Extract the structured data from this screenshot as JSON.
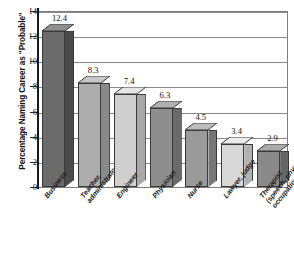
{
  "chart_data": {
    "type": "bar",
    "title": "",
    "xlabel": "",
    "ylabel": "Percentage Naming Career as \"Probable\"",
    "ylim": [
      0,
      14
    ],
    "yticks": [
      0,
      2,
      4,
      6,
      8,
      10,
      12,
      14
    ],
    "ytick_labels": [
      "0",
      "2",
      "4",
      "6",
      "8",
      "10",
      "12",
      "14"
    ],
    "grid": true,
    "legend": "none",
    "categories": [
      "Business",
      "Teacher, administrator",
      "Engineer",
      "Physician",
      "Nurse",
      "Lawyer, judge",
      "Therapist (speech, physical, occupational)"
    ],
    "category_lines": [
      [
        "Business"
      ],
      [
        "Teacher,",
        "administrator"
      ],
      [
        "Engineer"
      ],
      [
        "Physician"
      ],
      [
        "Nurse"
      ],
      [
        "Lawyer, judge"
      ],
      [
        "Therapist",
        "(speech, physical,",
        "occupational)"
      ]
    ],
    "values": [
      12.4,
      8.3,
      7.4,
      6.3,
      4.5,
      3.4,
      2.9
    ],
    "value_labels": [
      "12.4",
      "8.3",
      "7.4",
      "6.3",
      "4.5",
      "3.4",
      "2.9"
    ],
    "bar_colors": [
      "#6b6b6b",
      "#adadad",
      "#cfcfcf",
      "#8e8e8e",
      "#9a9a9a",
      "#d8d8d8",
      "#8a8a8a"
    ],
    "bar_side_colors": [
      "#4a4a4a",
      "#8a8a8a",
      "#a8a8a8",
      "#6a6a6a",
      "#767676",
      "#b2b2b2",
      "#666666"
    ],
    "bar_top_colors": [
      "#8f8f8f",
      "#c7c7c7",
      "#e6e6e6",
      "#b0b0b0",
      "#bcbcbc",
      "#ececec",
      "#ababab"
    ]
  },
  "axis": {
    "tick_0": "0",
    "tick_2": "2",
    "tick_4": "4",
    "tick_6": "6",
    "tick_8": "8",
    "tick_10": "10",
    "tick_12": "12",
    "tick_14": "14"
  },
  "colors": {
    "background": "#ffffff",
    "gridline": "#8a8a8a",
    "axis": "#1a1a1a",
    "text": "#111111"
  }
}
